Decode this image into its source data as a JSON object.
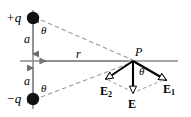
{
  "figure": {
    "type": "physics-vector-diagram",
    "canvas": {
      "width": 191,
      "height": 117,
      "background": "#ffffff"
    },
    "colors": {
      "stroke": "#000000",
      "axis_gray": "#8a8a8a",
      "dashed_gray": "#9a9a9a",
      "charge_fill": "#111111"
    }
  },
  "labels": {
    "positive_charge": "+q",
    "negative_charge": "−q",
    "distance_upper": "a",
    "distance_lower": "a",
    "radial_distance": "r",
    "point": "P",
    "theta_upper": "θ",
    "theta_lower": "θ",
    "theta_at_point": "θ",
    "field_one": "E",
    "field_one_sub": "1",
    "field_two": "E",
    "field_two_sub": "2",
    "field_resultant": "E"
  },
  "geometry": {
    "dipole_axis_x": 33,
    "positive_charge_y": 18,
    "negative_charge_y": 99,
    "midpoint_y": 61,
    "point_p_x": 133,
    "point_p_y": 61,
    "horizontal_axis_x_start": 20,
    "horizontal_axis_x_end": 178,
    "field_one_tip_x": 166,
    "field_one_tip_y": 80,
    "field_two_tip_x": 106,
    "field_two_tip_y": 80,
    "field_resultant_tip_x": 133,
    "field_resultant_tip_y": 93
  }
}
